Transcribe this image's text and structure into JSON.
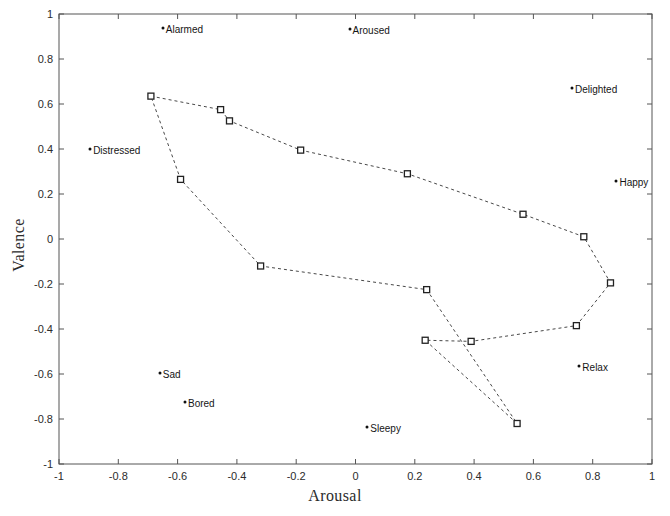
{
  "chart_data": {
    "type": "scatter",
    "title": "",
    "xlabel": "Arousal",
    "ylabel": "Valence",
    "xlim": [
      -1,
      1
    ],
    "ylim": [
      -1,
      1
    ],
    "grid": false,
    "legend": "none",
    "xticks": [
      "-1",
      "-0.8",
      "-0.6",
      "-0.4",
      "-0.2",
      "0",
      "0.2",
      "0.4",
      "0.6",
      "0.8",
      "1"
    ],
    "xtick_values": [
      -1,
      -0.8,
      -0.6,
      -0.4,
      -0.2,
      0,
      0.2,
      0.4,
      0.6,
      0.8,
      1
    ],
    "yticks": [
      "1",
      "0.8",
      "0.6",
      "0.4",
      "0.2",
      "0",
      "-0.2",
      "-0.4",
      "-0.6",
      "-0.8",
      "-1"
    ],
    "ytick_values": [
      1,
      0.8,
      0.6,
      0.4,
      0.2,
      0,
      -0.2,
      -0.4,
      -0.6,
      -0.8,
      -1
    ],
    "series": [
      {
        "name": "trajectory",
        "marker": "square-open",
        "linestyle": "dashed",
        "closed": true,
        "color": "#333333",
        "points": [
          {
            "x": -0.69,
            "y": 0.635
          },
          {
            "x": -0.455,
            "y": 0.575
          },
          {
            "x": -0.425,
            "y": 0.525
          },
          {
            "x": -0.185,
            "y": 0.395
          },
          {
            "x": 0.175,
            "y": 0.29
          },
          {
            "x": 0.565,
            "y": 0.11
          },
          {
            "x": 0.77,
            "y": 0.01
          },
          {
            "x": 0.86,
            "y": -0.195
          },
          {
            "x": 0.745,
            "y": -0.385
          },
          {
            "x": 0.39,
            "y": -0.455
          },
          {
            "x": 0.235,
            "y": -0.45
          },
          {
            "x": 0.545,
            "y": -0.82
          },
          {
            "x": 0.24,
            "y": -0.225
          },
          {
            "x": -0.32,
            "y": -0.12
          },
          {
            "x": -0.59,
            "y": 0.265
          }
        ]
      },
      {
        "name": "emotion-anchors",
        "marker": "dot",
        "linestyle": "none",
        "color": "#101010",
        "points": [
          {
            "x": -0.65,
            "y": 0.94,
            "label": "Alarmed"
          },
          {
            "x": -0.02,
            "y": 0.935,
            "label": "Aroused"
          },
          {
            "x": 0.73,
            "y": 0.67,
            "label": "Delighted"
          },
          {
            "x": -0.895,
            "y": 0.4,
            "label": "Distressed"
          },
          {
            "x": 0.88,
            "y": 0.26,
            "label": "Happy"
          },
          {
            "x": 0.755,
            "y": -0.565,
            "label": "Relax"
          },
          {
            "x": -0.66,
            "y": -0.595,
            "label": "Sad"
          },
          {
            "x": -0.575,
            "y": -0.725,
            "label": "Bored"
          },
          {
            "x": 0.04,
            "y": -0.835,
            "label": "Sleepy"
          }
        ]
      }
    ]
  }
}
